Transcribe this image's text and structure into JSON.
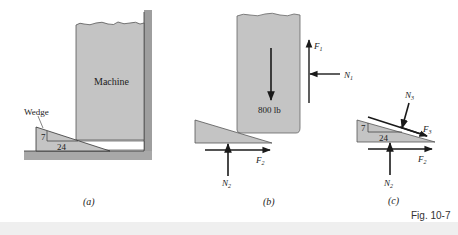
{
  "figure": {
    "caption": "Fig. 10-7",
    "colors": {
      "fill_gray": "#c4c4c4",
      "wall_gray": "#9e9e9e",
      "stroke": "#2a2a2a",
      "arrow": "#1a1a1a",
      "bottom_band": "#ececec"
    }
  },
  "panel_a": {
    "label": "(a)",
    "machine_label": "Machine",
    "wedge_label": "Wedge",
    "slope_rise": "7",
    "slope_run": "24"
  },
  "panel_b": {
    "label": "(b)",
    "weight_label": "800 lb",
    "forces": {
      "F1": "F",
      "F1_sub": "1",
      "N1": "N",
      "N1_sub": "1",
      "F2": "F",
      "F2_sub": "2",
      "N2": "N",
      "N2_sub": "2"
    }
  },
  "panel_c": {
    "label": "(c)",
    "slope_rise": "7",
    "slope_run": "24",
    "forces": {
      "N3": "N",
      "N3_sub": "3",
      "F3": "F",
      "F3_sub": "3",
      "F2": "F",
      "F2_sub": "2",
      "N2": "N",
      "N2_sub": "2"
    }
  }
}
